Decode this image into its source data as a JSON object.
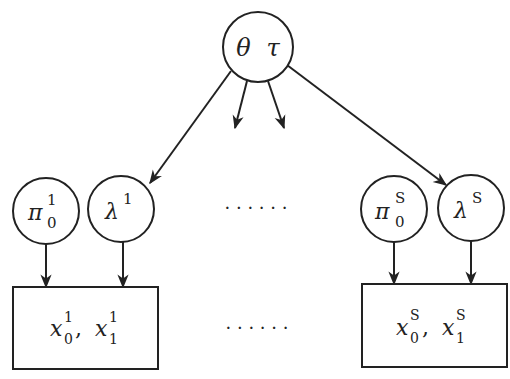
{
  "diagram": {
    "type": "graphical-model",
    "colors": {
      "stroke": "#222222",
      "fill": "#ffffff",
      "background": "#ffffff"
    },
    "root": {
      "id": "theta-tau",
      "label_a": "θ",
      "label_b": "τ",
      "cx": 258,
      "cy": 47,
      "r": 35
    },
    "groups": [
      {
        "index": "1",
        "pi": {
          "symbol": "π",
          "sub": "0",
          "sup": "1",
          "cx": 46,
          "cy": 211,
          "r": 33
        },
        "lambda": {
          "symbol": "λ",
          "sup": "1",
          "cx": 121,
          "cy": 209,
          "r": 33
        },
        "box": {
          "x": 13,
          "y": 287,
          "w": 145,
          "h": 82,
          "x0": "x",
          "x0_sub": "0",
          "x0_sup": "1",
          "sep": ",",
          "x1": "x",
          "x1_sub": "1",
          "x1_sup": "1"
        }
      },
      {
        "index": "S",
        "pi": {
          "symbol": "π",
          "sub": "0",
          "sup": "S",
          "cx": 394,
          "cy": 209,
          "r": 33
        },
        "lambda": {
          "symbol": "λ",
          "sup": "S",
          "cx": 471,
          "cy": 208,
          "r": 33
        },
        "box": {
          "x": 362,
          "y": 284,
          "w": 145,
          "h": 83,
          "x0": "x",
          "x0_sub": "0",
          "x0_sup": "S",
          "sep": ",",
          "x1": "x",
          "x1_sub": "1",
          "x1_sup": "S"
        }
      }
    ],
    "ellipsis_top": "· · · · · ·",
    "ellipsis_bottom": "· · · · · ·",
    "edges": [
      {
        "from": "theta-tau",
        "to": "lambda-1",
        "x1": 231,
        "y1": 71,
        "x2": 150,
        "y2": 183
      },
      {
        "from": "theta-tau",
        "to": "lambda-S",
        "x1": 287,
        "y1": 65,
        "x2": 446,
        "y2": 185
      },
      {
        "from": "theta-tau",
        "to": "elided-left",
        "x1": 247,
        "y1": 81,
        "x2": 235,
        "y2": 128
      },
      {
        "from": "theta-tau",
        "to": "elided-right",
        "x1": 268,
        "y1": 81,
        "x2": 284,
        "y2": 128
      },
      {
        "from": "pi-1",
        "to": "box-1",
        "x1": 46,
        "y1": 244,
        "x2": 46,
        "y2": 287
      },
      {
        "from": "lambda-1",
        "to": "box-1",
        "x1": 123,
        "y1": 242,
        "x2": 123,
        "y2": 287
      },
      {
        "from": "pi-S",
        "to": "box-S",
        "x1": 394,
        "y1": 242,
        "x2": 394,
        "y2": 284
      },
      {
        "from": "lambda-S",
        "to": "box-S",
        "x1": 471,
        "y1": 241,
        "x2": 471,
        "y2": 284
      }
    ]
  }
}
